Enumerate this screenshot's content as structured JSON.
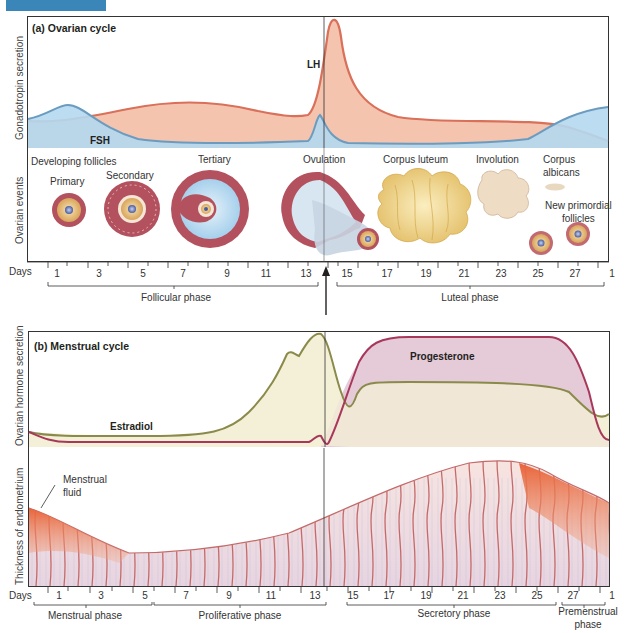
{
  "figure": {
    "tab_color": "#3a86b8"
  },
  "ovarian": {
    "title": "(a) Ovarian cycle",
    "y_label_top": "Gonadotropin secretion",
    "y_label_events": "Ovarian events",
    "hormones": {
      "lh": "LH",
      "fsh": "FSH"
    },
    "events": {
      "developing": "Developing follicles",
      "primary": "Primary",
      "secondary": "Secondary",
      "tertiary": "Tertiary",
      "ovulation": "Ovulation",
      "corpus_luteum": "Corpus luteum",
      "involution": "Involution",
      "corpus_albicans_1": "Corpus",
      "corpus_albicans_2": "albicans",
      "new_primordial_1": "New primordial",
      "new_primordial_2": "follicles"
    },
    "days_label": "Days",
    "days": [
      "1",
      "3",
      "5",
      "7",
      "9",
      "11",
      "13",
      "15",
      "17",
      "19",
      "21",
      "23",
      "25",
      "27",
      "1"
    ],
    "phases": {
      "follicular": "Follicular phase",
      "luteal": "Luteal phase"
    }
  },
  "menstrual": {
    "title": "(b) Menstrual cycle",
    "y_label_top": "Ovarian hormone secretion",
    "y_label_bottom": "Thickness of endometrium",
    "hormones": {
      "progesterone": "Progesterone",
      "estradiol": "Estradiol"
    },
    "annotation_1": "Menstrual",
    "annotation_2": "fluid",
    "days_label": "Days",
    "days": [
      "1",
      "3",
      "5",
      "7",
      "9",
      "11",
      "13",
      "15",
      "17",
      "19",
      "21",
      "23",
      "25",
      "27",
      "1"
    ],
    "phases": {
      "menstrual": "Menstrual phase",
      "proliferative": "Proliferative phase",
      "secretory": "Secretory phase",
      "premenstrual_1": "Premenstrual",
      "premenstrual_2": "phase"
    }
  },
  "colors": {
    "lh_fill": "#f4c4ae",
    "lh_line": "#d9705a",
    "fsh_fill": "#b4d8ef",
    "fsh_line": "#6b9cc0",
    "estradiol_fill": "#f4f0d8",
    "estradiol_line": "#8a8a4a",
    "progesterone_fill": "#e2c4d4",
    "progesterone_line": "#a8385a"
  }
}
